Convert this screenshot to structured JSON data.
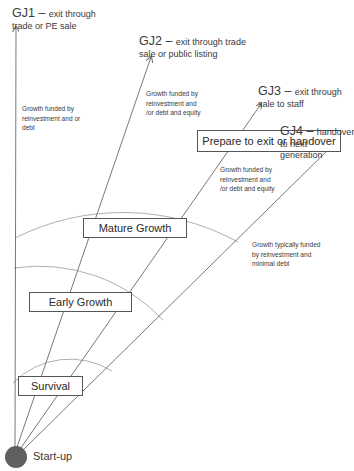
{
  "diagram": {
    "origin_label": "Start-up",
    "stages": [
      {
        "label": "Survival"
      },
      {
        "label": "Early Growth"
      },
      {
        "label": "Mature Growth"
      },
      {
        "label": "Prepare to exit or handover"
      }
    ],
    "journeys": [
      {
        "id": "GJ1",
        "title": "GJ1",
        "dash": " – ",
        "line1": "exit through",
        "line2": "trade or PE sale"
      },
      {
        "id": "GJ2",
        "title": "GJ2",
        "dash": " – ",
        "line1": "exit through trade",
        "line2": "sale or public listing"
      },
      {
        "id": "GJ3",
        "title": "GJ3",
        "dash": " – ",
        "line1": "exit through",
        "line2": "sale to staff"
      },
      {
        "id": "GJ4",
        "title": "GJ4",
        "dash": " – ",
        "line1": "handover",
        "line2": "to next",
        "line3": "generation"
      }
    ],
    "funding_notes": [
      {
        "lines": [
          "Growth funded by",
          "reinvestment and or",
          "debt"
        ]
      },
      {
        "lines": [
          "Growth funded by",
          "reinvestment and",
          "/or debt and equity"
        ]
      },
      {
        "lines": [
          "Growth funded by",
          "reinvestment and",
          "/or debt and equity"
        ]
      },
      {
        "lines": [
          "Growth typically funded",
          "by reinvestment and",
          "minimal  debt"
        ]
      }
    ],
    "colors": {
      "lines": "#6a6a6a",
      "arcs": "#9a9a9a",
      "origin": "#606060",
      "box_border": "#555555"
    }
  }
}
